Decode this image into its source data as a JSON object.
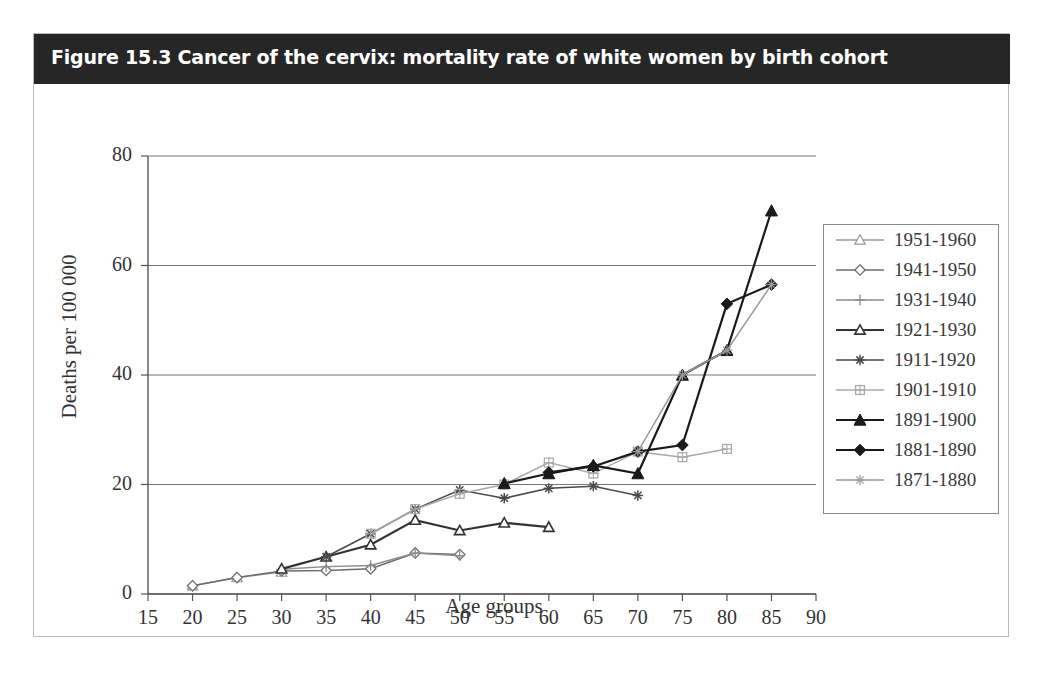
{
  "figure": {
    "title": "Figure 15.3 Cancer of the cervix: mortality rate of white women by birth cohort"
  },
  "chart_data": {
    "type": "line",
    "title": "Figure 15.3 Cancer of the cervix: mortality rate of white women by birth cohort",
    "xlabel": "Age groups",
    "ylabel": "Deaths per 100 000",
    "xlim": [
      15,
      90
    ],
    "ylim": [
      0,
      80
    ],
    "xticks": [
      15,
      20,
      25,
      30,
      35,
      40,
      45,
      50,
      55,
      60,
      65,
      70,
      75,
      80,
      85,
      90
    ],
    "yticks": [
      0,
      20,
      40,
      60,
      80
    ],
    "grid": "horizontal",
    "legend_position": "right",
    "series": [
      {
        "name": "1951-1960",
        "marker": "triangle-open",
        "color": "#9a9a9a",
        "x": [
          20,
          25,
          30
        ],
        "values": [
          1.5,
          3.0,
          4.0
        ]
      },
      {
        "name": "1941-1950",
        "marker": "diamond-open",
        "color": "#6e6e6e",
        "x": [
          20,
          25,
          30,
          35,
          40,
          45,
          50
        ],
        "values": [
          1.5,
          3.0,
          4.2,
          4.3,
          4.6,
          7.5,
          7.2
        ]
      },
      {
        "name": "1931-1940",
        "marker": "plus",
        "color": "#8c8c8c",
        "x": [
          30,
          35,
          40,
          45,
          50
        ],
        "values": [
          4.5,
          5.0,
          5.2,
          7.5,
          7.0
        ]
      },
      {
        "name": "1921-1930",
        "marker": "triangle-open-dark",
        "color": "#333333",
        "x": [
          30,
          35,
          40,
          45,
          50,
          55,
          60
        ],
        "values": [
          4.6,
          6.8,
          9.0,
          13.5,
          11.6,
          13.0,
          12.2
        ]
      },
      {
        "name": "1911-1920",
        "marker": "asterisk",
        "color": "#4a4a4a",
        "x": [
          35,
          40,
          45,
          50,
          55,
          60,
          65,
          70
        ],
        "values": [
          6.8,
          11.0,
          15.5,
          19.0,
          17.5,
          19.3,
          19.7,
          18.0
        ]
      },
      {
        "name": "1901-1910",
        "marker": "plus-box",
        "color": "#a8a8a8",
        "x": [
          40,
          45,
          50,
          55,
          60,
          65,
          70,
          75,
          80
        ],
        "values": [
          11.0,
          15.5,
          18.3,
          20.0,
          24.0,
          22.0,
          26.0,
          25.0,
          26.5
        ]
      },
      {
        "name": "1891-1900",
        "marker": "triangle-filled",
        "color": "#1a1a1a",
        "x": [
          55,
          60,
          65,
          70,
          75,
          80,
          85
        ],
        "values": [
          20.2,
          22.0,
          23.5,
          22.0,
          40.0,
          44.5,
          70.0
        ]
      },
      {
        "name": "1881-1890",
        "marker": "diamond-filled",
        "color": "#1a1a1a",
        "x": [
          60,
          65,
          70,
          75,
          80,
          85
        ],
        "values": [
          22.2,
          23.3,
          26.0,
          27.2,
          53.0,
          56.5
        ]
      },
      {
        "name": "1871-1880",
        "marker": "star-light",
        "color": "#9a9a9a",
        "x": [
          70,
          75,
          80,
          85
        ],
        "values": [
          26.0,
          40.0,
          44.5,
          56.5
        ]
      }
    ]
  }
}
